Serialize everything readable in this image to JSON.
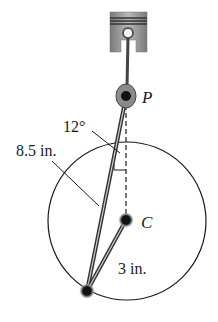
{
  "figure": {
    "labels": {
      "point_p": "P",
      "point_c": "C",
      "angle": "12°",
      "rod_length": "8.5 in.",
      "crank_length": "3 in."
    }
  },
  "colors": {
    "ink": "#1a1a1a",
    "piston_gray": "#9a9a9a",
    "piston_dark": "#555555"
  }
}
